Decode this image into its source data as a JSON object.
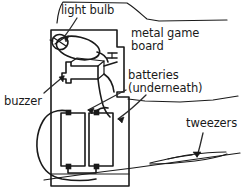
{
  "figure": {
    "background_color": "#ffffff",
    "ink_color": "#1a1a1a",
    "width": 242,
    "height": 195
  },
  "labels": {
    "light_bulb": "light bulb",
    "metal_game_board_line1": "metal game",
    "metal_game_board_line2": "board",
    "batteries_line1": "batteries",
    "batteries_line2": "(underneath)",
    "buzzer": "buzzer",
    "tweezers": "tweezers"
  },
  "parts": [
    {
      "name": "light-bulb",
      "label": "light bulb",
      "location": "upper-left of board"
    },
    {
      "name": "metal-game-board",
      "label": "metal game board",
      "location": "large vertical panel"
    },
    {
      "name": "buzzer",
      "label": "buzzer",
      "location": "middle-left of board"
    },
    {
      "name": "batteries",
      "label": "batteries (underneath)",
      "count": 2,
      "location": "lower half of board"
    },
    {
      "name": "tweezers",
      "label": "tweezers",
      "location": "right side, on table"
    }
  ]
}
